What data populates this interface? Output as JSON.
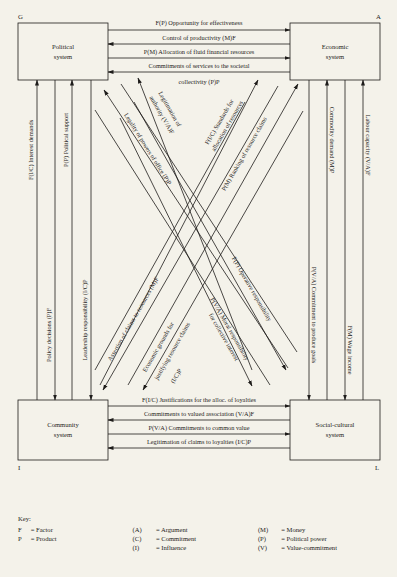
{
  "corners": {
    "G": "G",
    "A": "A",
    "I": "I",
    "L": "L"
  },
  "systems": {
    "political": [
      "Political",
      "system"
    ],
    "economic": [
      "Economic",
      "system"
    ],
    "community": [
      "Community",
      "system"
    ],
    "social_cultural": [
      "Social-cultural",
      "system"
    ]
  },
  "top_interchanges": [
    {
      "label": "F(P) Opportunity for effectiveness",
      "direction": "to-economic"
    },
    {
      "label": "Control of productivity (M)F",
      "direction": "to-political"
    },
    {
      "label": "P(M) Allocation of fluid financial resources",
      "direction": "to-economic"
    },
    {
      "label": "Commitments of services to the societal",
      "label2": "collectivity (P)P",
      "direction": "to-political"
    }
  ],
  "bottom_interchanges": [
    {
      "label": "F(I/C) Justifications for the alloc. of loyalties",
      "direction": "to-social-cultural"
    },
    {
      "label": "Commitments to valued association (V/A)F",
      "direction": "to-community"
    },
    {
      "label": "P(V/A) Commitments to common value",
      "direction": "to-social-cultural"
    },
    {
      "label": "Legitimation of claims to loyalties (I/C)P",
      "direction": "to-community"
    }
  ],
  "left_interchanges": [
    {
      "label": "F(I/C) Interest demands",
      "direction": "up"
    },
    {
      "label": "Policy decisions (P)F",
      "direction": "down"
    },
    {
      "label": "P(P) Political support",
      "direction": "up"
    },
    {
      "label": "Leadership responsibility (I/C)P",
      "direction": "down"
    }
  ],
  "right_interchanges": [
    {
      "label": "P(V/A) Commitment to produce goals",
      "direction": "down"
    },
    {
      "label": "Commodity demand (M)P",
      "direction": "up"
    },
    {
      "label": "F(M) Wage income",
      "direction": "down"
    },
    {
      "label": "Labour capacity (V/A)F",
      "direction": "up"
    }
  ],
  "diagonal_interchanges": [
    {
      "label": "Legality of powers of office (P)P",
      "direction": "to-political"
    },
    {
      "label": "Legitimation of",
      "label2": "authority (V/A)F",
      "direction": "to-political"
    },
    {
      "label": "F(P) Operative responsibility",
      "direction": "to-social-cultural"
    },
    {
      "label": "P(V/A) Moral responsibility",
      "label2": "for collective interest",
      "direction": "to-social-cultural"
    },
    {
      "label": "F(I/C) Standards for",
      "label2": "allocation of resources",
      "direction": "to-economic"
    },
    {
      "label": "P(M) Ranking of resource claims",
      "direction": "to-economic"
    },
    {
      "label": "Assertion of claims to resources (M)F",
      "direction": "to-community"
    },
    {
      "label": "Economic grounds for",
      "label2": "justifying resource claims",
      "label3": "(I/C)P",
      "direction": "to-community"
    }
  ],
  "key": {
    "title": "Key:",
    "rows": [
      [
        {
          "sym": "F",
          "eq": "= Factor"
        },
        {
          "sym": "(A)",
          "eq": "= Argument"
        },
        {
          "sym": "(M)",
          "eq": "= Money"
        }
      ],
      [
        {
          "sym": "P",
          "eq": "= Product"
        },
        {
          "sym": "(C)",
          "eq": "= Commitment"
        },
        {
          "sym": "(P)",
          "eq": "= Political power"
        }
      ],
      [
        {
          "sym": "",
          "eq": ""
        },
        {
          "sym": "(I)",
          "eq": "= Influence"
        },
        {
          "sym": "(V)",
          "eq": "= Value-commitment"
        }
      ]
    ]
  },
  "colors": {
    "background": "#f4f2ea",
    "ink": "#1e1c1a"
  }
}
